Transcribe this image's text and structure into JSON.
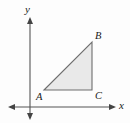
{
  "figure": {
    "type": "geometry-diagram",
    "background_color": "#fdfdfd",
    "canvas": {
      "width": 130,
      "height": 123
    },
    "axes": {
      "color": "#555555",
      "stroke_width": 1.1,
      "origin": {
        "x": 30,
        "y": 107
      },
      "x_axis": {
        "label": "x",
        "label_pos": {
          "x": 119,
          "y": 109
        },
        "line": {
          "x1": 10,
          "y1": 107,
          "x2": 114,
          "y2": 107
        },
        "arrow_start": {
          "x": 8,
          "y": 107
        },
        "arrow_end": {
          "x": 116,
          "y": 107
        }
      },
      "y_axis": {
        "label": "y",
        "label_pos": {
          "x": 25,
          "y": 13
        },
        "line": {
          "x1": 30,
          "y1": 19,
          "x2": 30,
          "y2": 118
        },
        "arrow_start": {
          "x": 30,
          "y": 17
        },
        "arrow_end": {
          "x": 30,
          "y": 120
        }
      }
    },
    "triangle": {
      "name": "ABC",
      "fill_color": "#e9e9e9",
      "stroke_color": "#6e6e6e",
      "stroke_width": 1.1,
      "right_angle_at": "C",
      "vertices": [
        {
          "label": "A",
          "x": 44,
          "y": 90,
          "label_x": 36,
          "label_y": 100
        },
        {
          "label": "B",
          "x": 92,
          "y": 42,
          "label_x": 95,
          "label_y": 39
        },
        {
          "label": "C",
          "x": 92,
          "y": 90,
          "label_x": 95,
          "label_y": 99
        }
      ],
      "points_path": "44,90 92,42 92,90"
    }
  }
}
